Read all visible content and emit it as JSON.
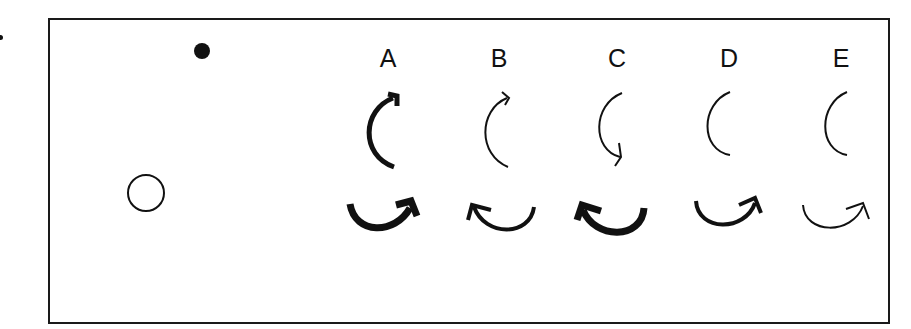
{
  "figure": {
    "options": [
      {
        "label": "A",
        "vertical_arrow": "clockwise-up, thick",
        "horizontal_arrow": "clockwise-up-right, thick"
      },
      {
        "label": "B",
        "vertical_arrow": "clockwise-up, thin",
        "horizontal_arrow": "counterclockwise-up-left, medium"
      },
      {
        "label": "C",
        "vertical_arrow": "counterclockwise-down, thin",
        "horizontal_arrow": "counterclockwise-up-left, thick"
      },
      {
        "label": "D",
        "vertical_arrow": "arc, no arrowhead, thin",
        "horizontal_arrow": "clockwise-up-right, medium"
      },
      {
        "label": "E",
        "vertical_arrow": "arc, no arrowhead, thin",
        "horizontal_arrow": "clockwise-up-right, thin"
      }
    ],
    "markers": {
      "filled_dot": "filled-circle",
      "hollow_circle": "open-circle"
    },
    "colors": {
      "ink": "#111111",
      "background": "#ffffff"
    }
  }
}
